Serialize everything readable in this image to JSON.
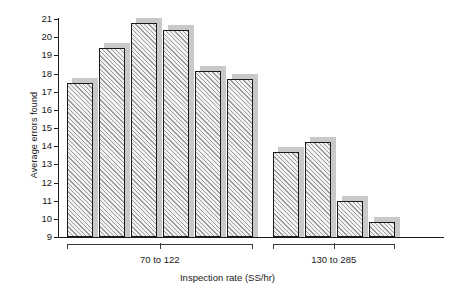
{
  "chart_data": {
    "type": "bar",
    "title": "",
    "xlabel": "Inspection rate (SS/hr)",
    "ylabel": "Average errors found",
    "ylim": [
      9,
      21
    ],
    "yticks": [
      9,
      10,
      11,
      12,
      13,
      14,
      15,
      16,
      17,
      18,
      19,
      20,
      21
    ],
    "ytick_labels": [
      "9",
      "10",
      "11",
      "12",
      "13",
      "14",
      "15",
      "16",
      "17",
      "18",
      "19",
      "20",
      "21"
    ],
    "grid": false,
    "legend": "none",
    "categories": [
      "1",
      "2",
      "3",
      "4",
      "5",
      "6",
      "7",
      "8",
      "9",
      "10"
    ],
    "values": [
      17.5,
      19.4,
      20.8,
      20.4,
      18.15,
      17.7,
      13.7,
      14.25,
      11.0,
      9.85
    ],
    "groups": [
      {
        "label": "70 to 122",
        "start_index": 0,
        "count": 6
      },
      {
        "label": "130 to 285",
        "start_index": 6,
        "count": 4
      }
    ],
    "bar_style": {
      "fill": "diagonal-hatch",
      "hatch_color": "#9a9a9a",
      "face_color": "#f2f2f2",
      "edge_color": "#1a1a1a",
      "shadow_color": "#c9c9c9"
    }
  }
}
